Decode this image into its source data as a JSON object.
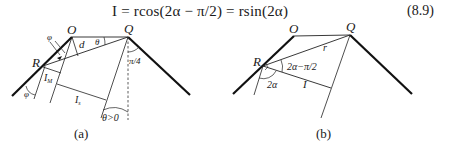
{
  "equation": {
    "text": "I = rcos(2α − π/2) = rsin(2α)",
    "number": "(8.9)"
  },
  "figure_a": {
    "caption": "(a)",
    "labels": {
      "O": "O",
      "Q": "Q",
      "R": "R",
      "d": "d",
      "theta": "θ",
      "phi_top": "φ",
      "phi_bottom": "φ",
      "IM": "I",
      "IM_sub": "M",
      "Is": "I",
      "Is_sub": "s",
      "pi4": "π/4",
      "theta_gt0": "θ>0"
    }
  },
  "figure_b": {
    "caption": "(b)",
    "labels": {
      "O": "O",
      "Q": "Q",
      "R": "R",
      "r": "r",
      "angle": "2α−π/2",
      "two_alpha": "2α",
      "I": "I"
    }
  }
}
